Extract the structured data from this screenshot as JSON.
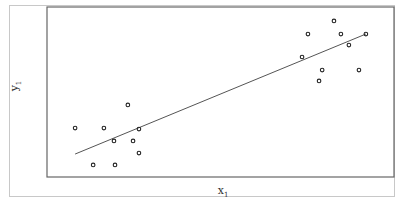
{
  "chart_data": {
    "type": "scatter",
    "title": "",
    "xlabel": "x",
    "xlabel_sub": "1",
    "ylabel": "y",
    "ylabel_sub": "1",
    "xlim": [
      0,
      100
    ],
    "ylim": [
      0,
      100
    ],
    "grid": false,
    "ticks": false,
    "series": [
      {
        "name": "observations",
        "marker": "open-circle",
        "points": [
          [
            8.1,
            28.8
          ],
          [
            16.4,
            28.8
          ],
          [
            23.3,
            42.4
          ],
          [
            26.5,
            28.2
          ],
          [
            19.3,
            21.2
          ],
          [
            24.8,
            21.2
          ],
          [
            26.5,
            14.1
          ],
          [
            13.3,
            7.1
          ],
          [
            19.6,
            7.1
          ],
          [
            82.7,
            91.8
          ],
          [
            75.2,
            84.1
          ],
          [
            84.7,
            84.1
          ],
          [
            91.9,
            84.1
          ],
          [
            87.0,
            77.6
          ],
          [
            73.5,
            70.6
          ],
          [
            79.3,
            62.9
          ],
          [
            89.9,
            62.9
          ],
          [
            78.4,
            56.5
          ]
        ]
      }
    ],
    "fit_line": {
      "name": "regression-line",
      "x": [
        8.1,
        91.9
      ],
      "y": [
        13.5,
        84.1
      ]
    }
  },
  "colors": {
    "marker": "#222222",
    "line": "#555555",
    "frame": "#666666",
    "outer_frame": "#c8c8c8"
  }
}
